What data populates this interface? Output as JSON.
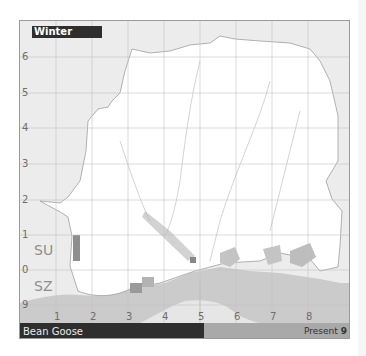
{
  "map": {
    "season_label": "Winter",
    "species_name": "Bean Goose",
    "status_label": "Present",
    "status_count": "9",
    "grid_squares": {
      "upper": "SU",
      "lower": "SZ"
    },
    "y_axis_labels": [
      "6",
      "5",
      "4",
      "3",
      "2",
      "1",
      "0",
      "9"
    ],
    "x_axis_labels": [
      "1",
      "2",
      "3",
      "4",
      "5",
      "6",
      "7",
      "8"
    ],
    "colors": {
      "background": "#ececec",
      "land": "#ffffff",
      "sea": "#c8c8c8",
      "present_cell": "#a9a9a9",
      "present_cell_dark": "#8e8e8e",
      "label_bar": "#2e2e2e"
    }
  }
}
